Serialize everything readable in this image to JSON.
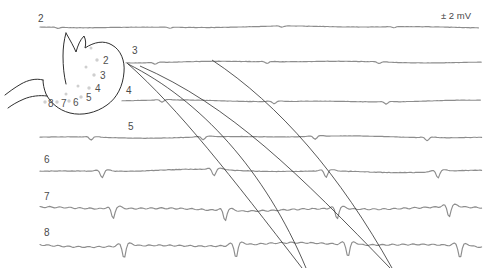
{
  "figure": {
    "scale_label": "± 2 mV",
    "trace_color": "#8d8d8d",
    "propagation_line_color": "#2e2e2e",
    "organ_outline_color": "#2f2f2f",
    "background": "#ffffff"
  },
  "channels": [
    {
      "label": "2",
      "label_x": 38,
      "label_y": 22,
      "baseline_y": 27,
      "x_start": 40,
      "x_end": 480,
      "amplitude": 1.0
    },
    {
      "label": "3",
      "label_x": 132,
      "label_y": 54,
      "baseline_y": 62,
      "x_start": 126,
      "x_end": 482,
      "amplitude": 1.6
    },
    {
      "label": "4",
      "label_x": 126,
      "label_y": 94,
      "baseline_y": 101,
      "x_start": 122,
      "x_end": 482,
      "amplitude": 2.2
    },
    {
      "label": "5",
      "label_x": 128,
      "label_y": 130,
      "baseline_y": 137,
      "x_start": 40,
      "x_end": 482,
      "amplitude": 3.0
    },
    {
      "label": "6",
      "label_x": 44,
      "label_y": 163,
      "baseline_y": 171,
      "x_start": 40,
      "x_end": 482,
      "amplitude": 6.5
    },
    {
      "label": "7",
      "label_x": 44,
      "label_y": 200,
      "baseline_y": 209,
      "x_start": 40,
      "x_end": 482,
      "amplitude": 10.0
    },
    {
      "label": "8",
      "label_x": 44,
      "label_y": 236,
      "baseline_y": 245,
      "x_start": 40,
      "x_end": 482,
      "amplitude": 12.0
    }
  ],
  "electrode_sites": [
    {
      "label": "2",
      "label_x": 103,
      "label_y": 64,
      "dot_x": 97,
      "dot_y": 60
    },
    {
      "label": "3",
      "label_x": 100,
      "label_y": 79,
      "dot_x": 94,
      "dot_y": 75
    },
    {
      "label": "4",
      "label_x": 95,
      "label_y": 92,
      "dot_x": 89,
      "dot_y": 88
    },
    {
      "label": "5",
      "label_x": 86,
      "label_y": 101,
      "dot_x": 81,
      "dot_y": 97
    },
    {
      "label": "6",
      "label_x": 73,
      "label_y": 106,
      "dot_x": 69,
      "dot_y": 101
    },
    {
      "label": "7",
      "label_x": 61,
      "label_y": 107,
      "dot_x": 57,
      "dot_y": 102
    },
    {
      "label": "8",
      "label_x": 48,
      "label_y": 107,
      "dot_x": 45,
      "dot_y": 102
    }
  ],
  "propagation_lines": [
    {
      "name": "wavefront-1",
      "path": "M 127 63 C 180 110 230 175 302 268"
    },
    {
      "name": "wavefront-2",
      "path": "M 140 66 C 230 105 300 175 390 268"
    },
    {
      "name": "wavefront-3",
      "path": "M 128 64 C 200 100 265 170 306 268"
    },
    {
      "name": "wavefront-4",
      "path": "M 212 60 C 280 105 340 175 392 268"
    }
  ],
  "chart_data": {
    "type": "line",
    "xlabel": "",
    "ylabel": "",
    "annotations": [
      "± 2 mV"
    ],
    "series": [
      {
        "name": "2",
        "note": "proximal corpus, low amplitude, near-flat baseline"
      },
      {
        "name": "3",
        "note": "corpus, small slow-wave deflections"
      },
      {
        "name": "4",
        "note": "corpus, small-to-moderate deflections"
      },
      {
        "name": "5",
        "note": "mid corpus, moderate downward spikes"
      },
      {
        "name": "6",
        "note": "distal corpus, clear downward spikes"
      },
      {
        "name": "7",
        "note": "antrum, large downward spikes"
      },
      {
        "name": "8",
        "note": "distal antrum, largest downward spikes"
      }
    ],
    "legend_position": "none",
    "grid": false
  }
}
